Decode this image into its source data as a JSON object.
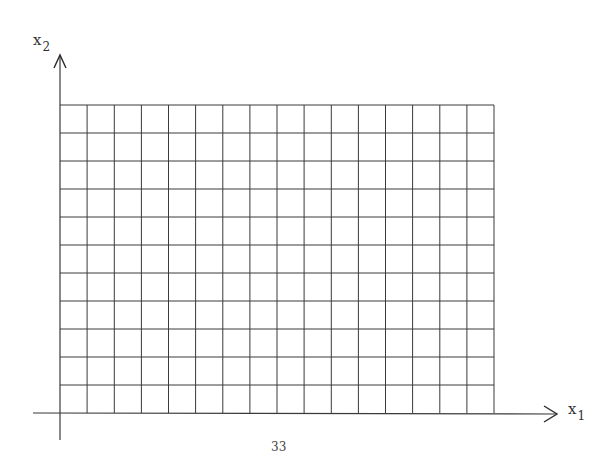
{
  "diagram": {
    "type": "coordinate-grid",
    "x_axis": {
      "label_main": "x",
      "label_sub": "1"
    },
    "y_axis": {
      "label_main": "x",
      "label_sub": "2"
    },
    "grid": {
      "columns": 16,
      "rows": 11,
      "left": 60,
      "right": 494,
      "top": 105,
      "bottom": 413
    },
    "colors": {
      "line": "#3a3a3a",
      "background": "#ffffff"
    }
  },
  "footer": {
    "page_number": "33"
  }
}
